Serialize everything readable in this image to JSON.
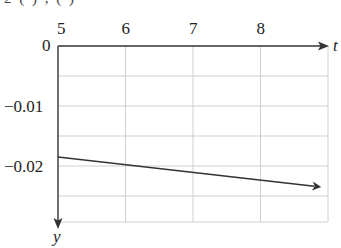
{
  "chart_data": {
    "type": "line",
    "title": "",
    "xlabel": "t",
    "ylabel": "y",
    "x_ticks": [
      5,
      6,
      7,
      8
    ],
    "y_ticks": [
      0,
      -0.01,
      -0.02
    ],
    "y_tick_labels": [
      "0",
      "−0.01",
      "−0.02"
    ],
    "x_tick_labels": [
      "5",
      "6",
      "7",
      "8"
    ],
    "xlim": [
      5,
      9
    ],
    "ylim": [
      -0.029,
      0
    ],
    "y_axis_inverted": true,
    "grid": true,
    "grid_minor_y_step": 0.005,
    "series": [
      {
        "name": "y(t)",
        "x": [
          5,
          8.9
        ],
        "values": [
          -0.0185,
          -0.0235
        ],
        "arrow_end": true,
        "color": "#333333"
      }
    ],
    "legend": null
  },
  "axes": {
    "x_axis_label": "t",
    "y_axis_label": "y",
    "origin_label": "0"
  },
  "colors": {
    "axis": "#333333",
    "grid": "#cfcfcf",
    "line": "#3a3a3a",
    "text": "#222222"
  },
  "cut_text": "2 ( ) , ( )"
}
